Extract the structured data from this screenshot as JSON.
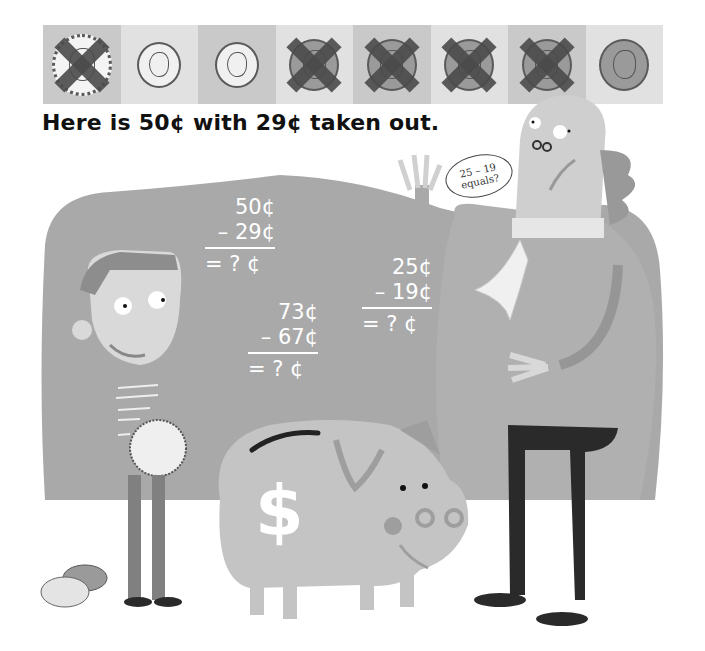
{
  "coin_strip": {
    "cells": [
      {
        "coin": "quarter",
        "value_cents": 25,
        "crossed_out": true,
        "shade": "dark"
      },
      {
        "coin": "dime",
        "value_cents": 10,
        "crossed_out": false,
        "shade": "light"
      },
      {
        "coin": "dime",
        "value_cents": 10,
        "crossed_out": false,
        "shade": "dark"
      },
      {
        "coin": "penny",
        "value_cents": 1,
        "crossed_out": true,
        "shade": "light"
      },
      {
        "coin": "penny",
        "value_cents": 1,
        "crossed_out": true,
        "shade": "dark"
      },
      {
        "coin": "penny",
        "value_cents": 1,
        "crossed_out": true,
        "shade": "light"
      },
      {
        "coin": "penny",
        "value_cents": 1,
        "crossed_out": true,
        "shade": "dark"
      },
      {
        "coin": "penny",
        "value_cents": 1,
        "crossed_out": false,
        "shade": "light"
      }
    ]
  },
  "caption": "Here is 50¢ with 29¢ taken out.",
  "speech_bubble": {
    "line1": "25 – 19",
    "line2": "equals?"
  },
  "equations": [
    {
      "top": "50¢",
      "minus": "– 29¢",
      "result": "= ? ¢"
    },
    {
      "top": "73¢",
      "minus": "– 67¢",
      "result": "= ? ¢"
    },
    {
      "top": "25¢",
      "minus": "– 19¢",
      "result": "= ? ¢"
    }
  ],
  "illustration": {
    "piggy_bank_symbol": "$",
    "colors": {
      "board": "#a9a9a9",
      "piggy": "#c4c4c4",
      "man_coat": "#b0b0b0",
      "trousers": "#2a2a2a",
      "boy_pants": "#808080"
    }
  }
}
